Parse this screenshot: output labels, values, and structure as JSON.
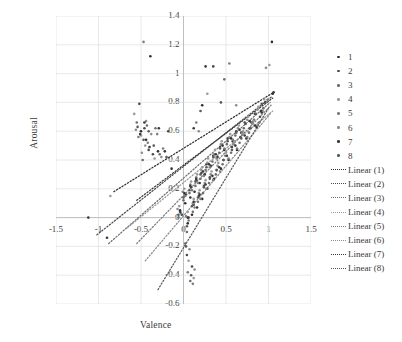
{
  "chart_data": {
    "type": "scatter",
    "title": "",
    "xlabel": "Valence",
    "ylabel": "Arousal",
    "xlim": [
      -1.5,
      1.5
    ],
    "ylim": [
      -0.6,
      1.4
    ],
    "xticks": [
      "-1.5",
      "-1",
      "-0.5",
      "0",
      "0.5",
      "1",
      "1.5"
    ],
    "xtick_values": [
      -1.5,
      -1,
      -0.5,
      0,
      0.5,
      1,
      1.5
    ],
    "yticks": [
      "1.4",
      "1.2",
      "1",
      "0.8",
      "0.6",
      "0.4",
      "0.2",
      "0",
      "-0.2",
      "-0.4",
      "-0.6"
    ],
    "ytick_values": [
      1.4,
      1.2,
      1.0,
      0.8,
      0.6,
      0.4,
      0.2,
      0,
      -0.2,
      -0.4,
      -0.6
    ],
    "grid": true,
    "grid_color": "#e2e2e2",
    "axis_color": "#bfbfbf",
    "legend_position": "right",
    "marker_size": 2.6,
    "series": [
      {
        "name": "1",
        "color": "#2f2f2f",
        "points": [
          [
            -0.5,
            0.6
          ],
          [
            -0.44,
            0.54
          ],
          [
            -0.39,
            1.12
          ],
          [
            -0.3,
            0.46
          ],
          [
            -0.14,
            0.34
          ],
          [
            -0.04,
            0.05
          ],
          [
            0.02,
            0.1
          ],
          [
            0.05,
            -0.04
          ],
          [
            0.08,
            0.14
          ],
          [
            0.1,
            0.02
          ],
          [
            0.13,
            0.18
          ],
          [
            0.16,
            0.07
          ],
          [
            0.19,
            0.24
          ],
          [
            0.22,
            0.13
          ],
          [
            0.25,
            0.3
          ],
          [
            0.28,
            0.2
          ],
          [
            0.32,
            0.36
          ],
          [
            0.36,
            0.27
          ],
          [
            0.4,
            0.42
          ],
          [
            0.44,
            0.34
          ],
          [
            0.48,
            0.47
          ],
          [
            0.53,
            0.4
          ],
          [
            0.58,
            0.53
          ],
          [
            0.63,
            0.47
          ],
          [
            0.68,
            0.59
          ],
          [
            0.74,
            0.55
          ],
          [
            0.8,
            0.66
          ],
          [
            0.86,
            0.63
          ],
          [
            0.92,
            0.73
          ],
          [
            1.05,
            0.86
          ],
          [
            1.04,
            1.22
          ],
          [
            0.22,
            0.78
          ]
        ]
      },
      {
        "name": "2",
        "color": "#4a4a4a",
        "points": [
          [
            -0.52,
            0.79
          ],
          [
            -0.46,
            0.62
          ],
          [
            -0.41,
            0.47
          ],
          [
            -0.36,
            0.44
          ],
          [
            -0.18,
            0.6
          ],
          [
            -0.02,
            0.02
          ],
          [
            0.03,
            0.16
          ],
          [
            0.06,
            0.0
          ],
          [
            0.09,
            0.21
          ],
          [
            0.12,
            0.09
          ],
          [
            0.15,
            0.26
          ],
          [
            0.18,
            0.15
          ],
          [
            0.21,
            0.31
          ],
          [
            0.24,
            0.22
          ],
          [
            0.27,
            0.37
          ],
          [
            0.31,
            0.28
          ],
          [
            0.35,
            0.43
          ],
          [
            0.39,
            0.33
          ],
          [
            0.43,
            0.49
          ],
          [
            0.47,
            0.4
          ],
          [
            0.52,
            0.55
          ],
          [
            0.57,
            0.49
          ],
          [
            0.62,
            0.6
          ],
          [
            0.67,
            0.56
          ],
          [
            0.72,
            0.66
          ],
          [
            0.78,
            0.62
          ],
          [
            0.84,
            0.72
          ],
          [
            0.9,
            0.7
          ],
          [
            0.96,
            0.8
          ],
          [
            0.04,
            -0.26
          ],
          [
            0.1,
            -0.34
          ],
          [
            0.35,
            1.05
          ]
        ]
      },
      {
        "name": "3",
        "color": "#6e6e6e",
        "points": [
          [
            -0.55,
            0.66
          ],
          [
            -0.48,
            0.4
          ],
          [
            -0.43,
            0.64
          ],
          [
            -0.33,
            0.62
          ],
          [
            -0.28,
            0.44
          ],
          [
            -0.06,
            0.0
          ],
          [
            0.0,
            0.12
          ],
          [
            0.04,
            -0.1
          ],
          [
            0.07,
            0.17
          ],
          [
            0.11,
            0.04
          ],
          [
            0.14,
            0.22
          ],
          [
            0.17,
            0.11
          ],
          [
            0.2,
            0.27
          ],
          [
            0.23,
            0.17
          ],
          [
            0.26,
            0.33
          ],
          [
            0.3,
            0.24
          ],
          [
            0.34,
            0.39
          ],
          [
            0.38,
            0.3
          ],
          [
            0.42,
            0.45
          ],
          [
            0.46,
            0.37
          ],
          [
            0.51,
            0.51
          ],
          [
            0.56,
            0.45
          ],
          [
            0.61,
            0.57
          ],
          [
            0.66,
            0.52
          ],
          [
            0.71,
            0.62
          ],
          [
            0.77,
            0.59
          ],
          [
            0.83,
            0.68
          ],
          [
            0.89,
            0.66
          ],
          [
            0.94,
            0.76
          ],
          [
            0.02,
            -0.18
          ],
          [
            0.08,
            -0.44
          ],
          [
            0.48,
            0.96
          ]
        ]
      },
      {
        "name": "4",
        "color": "#9a9a9a",
        "points": [
          [
            -0.58,
            0.72
          ],
          [
            -0.5,
            0.57
          ],
          [
            -0.45,
            0.5
          ],
          [
            -0.34,
            0.41
          ],
          [
            -0.86,
            0.15
          ],
          [
            -0.05,
            0.08
          ],
          [
            0.01,
            0.2
          ],
          [
            0.05,
            0.04
          ],
          [
            0.09,
            0.25
          ],
          [
            0.12,
            0.13
          ],
          [
            0.16,
            0.3
          ],
          [
            0.19,
            0.19
          ],
          [
            0.22,
            0.35
          ],
          [
            0.26,
            0.26
          ],
          [
            0.29,
            0.41
          ],
          [
            0.33,
            0.32
          ],
          [
            0.37,
            0.47
          ],
          [
            0.41,
            0.38
          ],
          [
            0.45,
            0.53
          ],
          [
            0.5,
            0.45
          ],
          [
            0.55,
            0.58
          ],
          [
            0.6,
            0.53
          ],
          [
            0.65,
            0.64
          ],
          [
            0.7,
            0.6
          ],
          [
            0.76,
            0.7
          ],
          [
            0.82,
            0.67
          ],
          [
            0.88,
            0.77
          ],
          [
            0.95,
            0.82
          ],
          [
            1.01,
            1.06
          ],
          [
            0.06,
            -0.3
          ],
          [
            0.12,
            -0.42
          ],
          [
            0.28,
            0.86
          ]
        ]
      },
      {
        "name": "5",
        "color": "#7d7d7d",
        "points": [
          [
            -0.53,
            0.56
          ],
          [
            -0.47,
            1.22
          ],
          [
            -0.42,
            0.52
          ],
          [
            -0.31,
            0.58
          ],
          [
            -0.24,
            0.48
          ],
          [
            -0.03,
            0.03
          ],
          [
            0.02,
            0.15
          ],
          [
            0.06,
            -0.02
          ],
          [
            0.1,
            0.19
          ],
          [
            0.13,
            0.07
          ],
          [
            0.17,
            0.24
          ],
          [
            0.2,
            0.13
          ],
          [
            0.24,
            0.29
          ],
          [
            0.27,
            0.2
          ],
          [
            0.31,
            0.35
          ],
          [
            0.35,
            0.26
          ],
          [
            0.39,
            0.41
          ],
          [
            0.43,
            0.32
          ],
          [
            0.48,
            0.48
          ],
          [
            0.53,
            0.41
          ],
          [
            0.58,
            0.54
          ],
          [
            0.63,
            0.48
          ],
          [
            0.69,
            0.59
          ],
          [
            0.75,
            0.56
          ],
          [
            0.81,
            0.66
          ],
          [
            0.87,
            0.64
          ],
          [
            0.93,
            0.74
          ],
          [
            0.99,
            0.82
          ],
          [
            0.15,
            0.66
          ],
          [
            0.05,
            -0.38
          ],
          [
            0.11,
            -0.46
          ],
          [
            0.54,
            1.07
          ]
        ]
      },
      {
        "name": "6",
        "color": "#8c8c8c",
        "points": [
          [
            -0.56,
            0.61
          ],
          [
            -0.49,
            0.45
          ],
          [
            -0.44,
            0.67
          ],
          [
            -0.38,
            0.58
          ],
          [
            -0.26,
            0.42
          ],
          [
            -0.07,
            0.06
          ],
          [
            -0.01,
            0.18
          ],
          [
            0.03,
            0.01
          ],
          [
            0.08,
            0.23
          ],
          [
            0.11,
            0.1
          ],
          [
            0.15,
            0.28
          ],
          [
            0.18,
            0.17
          ],
          [
            0.21,
            0.33
          ],
          [
            0.25,
            0.24
          ],
          [
            0.28,
            0.38
          ],
          [
            0.32,
            0.3
          ],
          [
            0.36,
            0.44
          ],
          [
            0.4,
            0.36
          ],
          [
            0.44,
            0.51
          ],
          [
            0.49,
            0.43
          ],
          [
            0.54,
            0.56
          ],
          [
            0.59,
            0.51
          ],
          [
            0.64,
            0.62
          ],
          [
            0.69,
            0.58
          ],
          [
            0.75,
            0.68
          ],
          [
            0.81,
            0.65
          ],
          [
            0.87,
            0.75
          ],
          [
            0.97,
            1.04
          ],
          [
            0.18,
            0.6
          ],
          [
            0.07,
            -0.22
          ],
          [
            0.13,
            -0.36
          ],
          [
            0.62,
            0.78
          ]
        ]
      },
      {
        "name": "7",
        "color": "#383838",
        "points": [
          [
            -0.51,
            0.58
          ],
          [
            -0.46,
            0.66
          ],
          [
            -0.4,
            0.49
          ],
          [
            -0.29,
            0.62
          ],
          [
            -0.22,
            0.46
          ],
          [
            -0.04,
            0.04
          ],
          [
            0.01,
            0.17
          ],
          [
            0.05,
            0.0
          ],
          [
            0.08,
            0.22
          ],
          [
            0.12,
            0.11
          ],
          [
            0.15,
            0.27
          ],
          [
            0.19,
            0.16
          ],
          [
            0.23,
            0.32
          ],
          [
            0.26,
            0.23
          ],
          [
            0.3,
            0.37
          ],
          [
            0.34,
            0.29
          ],
          [
            0.38,
            0.44
          ],
          [
            0.42,
            0.35
          ],
          [
            0.46,
            0.5
          ],
          [
            0.51,
            0.43
          ],
          [
            0.56,
            0.55
          ],
          [
            0.61,
            0.5
          ],
          [
            0.66,
            0.61
          ],
          [
            0.72,
            0.57
          ],
          [
            0.78,
            0.67
          ],
          [
            0.84,
            0.64
          ],
          [
            0.91,
            0.74
          ],
          [
            1.06,
            0.87
          ],
          [
            0.12,
            0.62
          ],
          [
            -1.12,
            0.0
          ],
          [
            -0.9,
            -0.14
          ],
          [
            0.26,
            1.05
          ]
        ]
      },
      {
        "name": "8",
        "color": "#5a5a5a",
        "points": [
          [
            -0.54,
            0.63
          ],
          [
            -0.47,
            0.54
          ],
          [
            -0.41,
            0.6
          ],
          [
            -0.35,
            0.5
          ],
          [
            -0.2,
            0.42
          ],
          [
            -0.06,
            0.02
          ],
          [
            0.0,
            0.14
          ],
          [
            0.04,
            -0.06
          ],
          [
            0.07,
            0.19
          ],
          [
            0.1,
            0.08
          ],
          [
            0.14,
            0.25
          ],
          [
            0.17,
            0.14
          ],
          [
            0.2,
            0.3
          ],
          [
            0.24,
            0.21
          ],
          [
            0.27,
            0.35
          ],
          [
            0.31,
            0.27
          ],
          [
            0.35,
            0.42
          ],
          [
            0.39,
            0.33
          ],
          [
            0.43,
            0.48
          ],
          [
            0.47,
            0.4
          ],
          [
            0.52,
            0.53
          ],
          [
            0.57,
            0.47
          ],
          [
            0.62,
            0.59
          ],
          [
            0.68,
            0.55
          ],
          [
            0.73,
            0.65
          ],
          [
            0.79,
            0.62
          ],
          [
            0.85,
            0.72
          ],
          [
            0.92,
            0.79
          ],
          [
            0.2,
            0.74
          ],
          [
            0.03,
            -0.2
          ],
          [
            0.09,
            -0.4
          ],
          [
            0.44,
            0.8
          ]
        ]
      }
    ],
    "trendlines": [
      {
        "name": "Linear (1)",
        "color": "#2f2f2f",
        "x0": -0.82,
        "y0": 0.18,
        "x1": 1.06,
        "y1": 0.87
      },
      {
        "name": "Linear (2)",
        "color": "#4a4a4a",
        "x0": -1.02,
        "y0": -0.12,
        "x1": 1.04,
        "y1": 0.84
      },
      {
        "name": "Linear (3)",
        "color": "#6e6e6e",
        "x0": -0.88,
        "y0": -0.18,
        "x1": 1.02,
        "y1": 0.8
      },
      {
        "name": "Linear (4)",
        "color": "#9a9a9a",
        "x0": -0.66,
        "y0": -0.07,
        "x1": 1.05,
        "y1": 0.74
      },
      {
        "name": "Linear (5)",
        "color": "#7d7d7d",
        "x0": -0.55,
        "y0": -0.18,
        "x1": 1.03,
        "y1": 0.78
      },
      {
        "name": "Linear (6)",
        "color": "#8c8c8c",
        "x0": -0.45,
        "y0": -0.3,
        "x1": 1.02,
        "y1": 0.72
      },
      {
        "name": "Linear (7)",
        "color": "#383838",
        "x0": -0.55,
        "y0": 0.12,
        "x1": 1.05,
        "y1": 0.83
      },
      {
        "name": "Linear (8)",
        "color": "#5a5a5a",
        "x0": -0.3,
        "y0": -0.5,
        "x1": 1.0,
        "y1": 0.76
      }
    ]
  },
  "legend": {
    "marker_entries": [
      "1",
      "2",
      "3",
      "4",
      "5",
      "6",
      "7",
      "8"
    ],
    "line_entries": [
      "Linear (1)",
      "Linear (2)",
      "Linear (3)",
      "Linear (4)",
      "Linear (5)",
      "Linear (6)",
      "Linear (7)",
      "Linear (8)"
    ]
  }
}
